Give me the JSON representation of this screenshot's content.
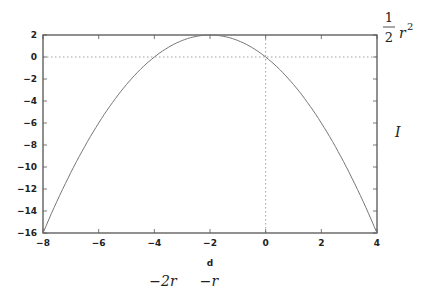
{
  "chart_data": {
    "type": "line",
    "title": "",
    "xlabel": "d",
    "ylabel": "",
    "xlim": [
      -8,
      4
    ],
    "ylim": [
      -16,
      2
    ],
    "x_ticks": [
      -8,
      -6,
      -4,
      -2,
      0,
      2,
      4
    ],
    "y_ticks": [
      2,
      0,
      -2,
      -4,
      -6,
      -8,
      -10,
      -12,
      -14,
      -16
    ],
    "x_tick_labels": [
      "-8",
      "-6",
      "-4",
      "-2",
      "0",
      "2",
      "4"
    ],
    "y_tick_labels": [
      "2",
      "0",
      "-2",
      "-4",
      "-6",
      "-8",
      "-10",
      "-12",
      "-14",
      "-16"
    ],
    "grid": false,
    "reference_lines": [
      {
        "orientation": "horizontal",
        "value": 0,
        "style": "dotted"
      },
      {
        "orientation": "vertical",
        "value": 0,
        "style": "dotted"
      }
    ],
    "series": [
      {
        "name": "I(d)",
        "x": [
          -8,
          -7,
          -6,
          -5,
          -4,
          -3,
          -2,
          -1,
          0,
          1,
          2,
          3,
          4
        ],
        "y": [
          -16,
          -10.5,
          -6,
          -2.5,
          0,
          1.5,
          2,
          1.5,
          0,
          -2.5,
          -6,
          -10.5,
          -16
        ]
      }
    ],
    "annotations": [
      {
        "text": "½r²",
        "position": "right of y=2",
        "kind": "math"
      },
      {
        "text": "I",
        "position": "right side, mid-height",
        "kind": "math"
      },
      {
        "text": "-2r",
        "position": "below x=-4",
        "kind": "math"
      },
      {
        "text": "-r",
        "position": "below x=-2",
        "kind": "math"
      }
    ]
  },
  "labels": {
    "xaxis_name": "d",
    "half": "1",
    "half_den": "2",
    "r": "r",
    "sq": "2",
    "I": "I",
    "minus_2r": "−2r",
    "minus_r": "−r"
  }
}
